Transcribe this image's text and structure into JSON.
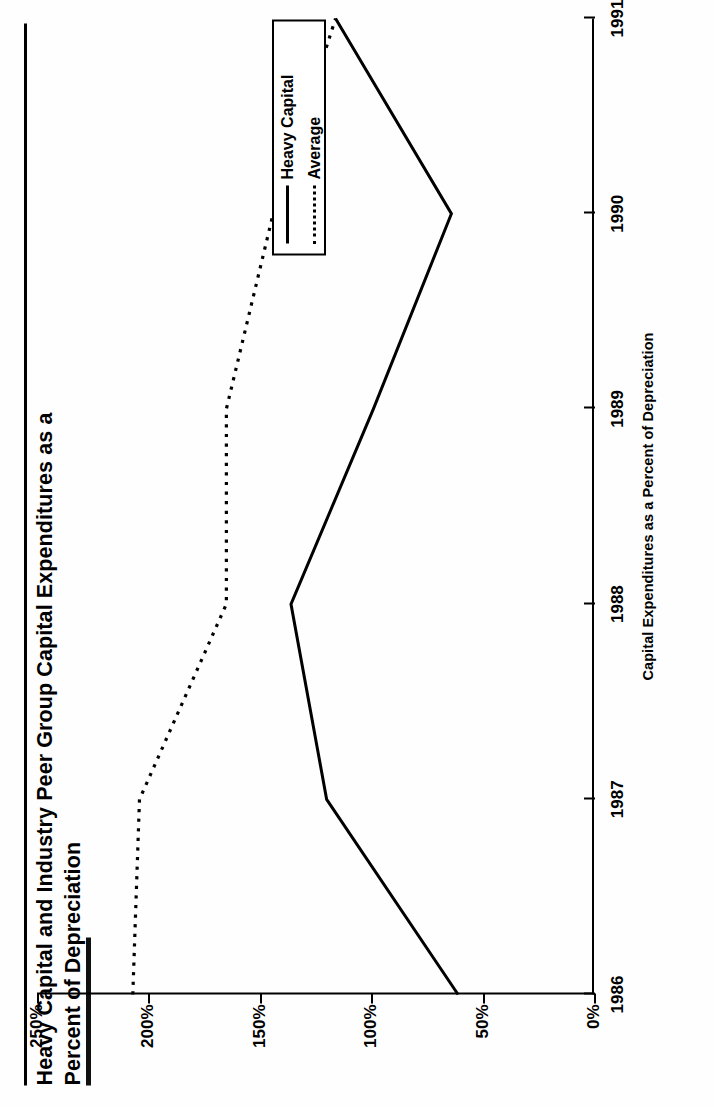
{
  "title": {
    "line1": "Heavy Capital and Industry Peer Group Capital Expenditures as a",
    "line2": "Percent of Depreciation"
  },
  "legend": {
    "entries": [
      {
        "label": "Heavy Capital",
        "style": "solid"
      },
      {
        "label": "Average",
        "style": "dotted"
      }
    ]
  },
  "axes": {
    "value_axis_title": "Capital Expenditures as a Percent of Depreciation",
    "value_ticks": [
      "0%",
      "50%",
      "100%",
      "150%",
      "200%",
      "250%"
    ],
    "category_ticks": [
      "1986",
      "1987",
      "1988",
      "1989",
      "1990",
      "1991"
    ]
  },
  "chart_data": {
    "type": "line",
    "title": "Heavy Capital and Industry Peer Group Capital Expenditures as a Percent of Depreciation",
    "xlabel": "",
    "ylabel": "Capital Expenditures as a Percent of Depreciation",
    "categories": [
      "1986",
      "1987",
      "1988",
      "1989",
      "1990",
      "1991"
    ],
    "x": [
      1986,
      1987,
      1988,
      1989,
      1990,
      1991
    ],
    "ylim": [
      0,
      250
    ],
    "ytick_values": [
      0,
      50,
      100,
      150,
      200,
      250
    ],
    "ytick_labels": [
      "0%",
      "50%",
      "100%",
      "150%",
      "200%",
      "250%"
    ],
    "grid": false,
    "legend_position": "upper right",
    "orientation": "page rotated 90 degrees clockwise",
    "series": [
      {
        "name": "Heavy Capital",
        "style": "solid",
        "values": [
          61,
          120,
          136,
          99,
          64,
          116
        ]
      },
      {
        "name": "Average",
        "style": "dotted",
        "values": [
          207,
          204,
          165,
          165,
          144,
          116
        ]
      }
    ]
  }
}
